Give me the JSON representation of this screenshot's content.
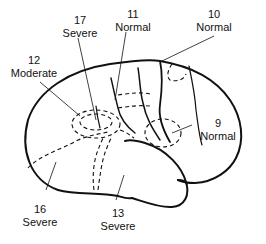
{
  "diagram": {
    "type": "lateral-brain-view",
    "stroke_color": "#111111",
    "background": "#ffffff"
  },
  "labels": [
    {
      "id": "area-17",
      "number": "17",
      "status": "Severe"
    },
    {
      "id": "area-11",
      "number": "11",
      "status": "Normal"
    },
    {
      "id": "area-10",
      "number": "10",
      "status": "Normal"
    },
    {
      "id": "area-12",
      "number": "12",
      "status": "Moderate"
    },
    {
      "id": "area-9",
      "number": "9",
      "status": "Normal"
    },
    {
      "id": "area-16",
      "number": "16",
      "status": "Severe"
    },
    {
      "id": "area-13",
      "number": "13",
      "status": "Severe"
    }
  ]
}
